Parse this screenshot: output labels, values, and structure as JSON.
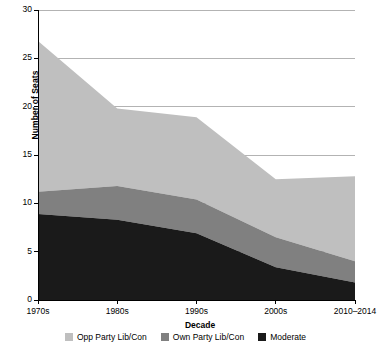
{
  "chart_data": {
    "type": "area",
    "title": "",
    "subtitle": "",
    "xlabel": "Decade",
    "ylabel": "Number of Seats",
    "categories": [
      "1970s",
      "1980s",
      "1990s",
      "2000s",
      "2010–2014"
    ],
    "ylim": [
      0,
      30
    ],
    "yticks": [
      0,
      5,
      10,
      15,
      20,
      25,
      30
    ],
    "ytick_labels": [
      "0",
      "5",
      "10",
      "15",
      "20",
      "25",
      "30"
    ],
    "grid": "horizontal",
    "stacked": true,
    "legend_position": "bottom",
    "series": [
      {
        "name": "Opp Party Lib/Con",
        "color": "#bfbfbf",
        "values": [
          15.6,
          8.0,
          8.5,
          6.0,
          8.8
        ]
      },
      {
        "name": "Own Party Lib/Con",
        "color": "#808080",
        "values": [
          2.3,
          3.5,
          3.5,
          3.1,
          2.2
        ]
      },
      {
        "name": "Moderate",
        "color": "#1a1a1a",
        "values": [
          8.9,
          8.3,
          6.9,
          3.4,
          1.8
        ]
      }
    ],
    "stack_tops": {
      "moderate": [
        8.9,
        8.3,
        6.9,
        3.4,
        1.8
      ],
      "own_party": [
        11.2,
        11.8,
        10.4,
        6.5,
        4.0
      ],
      "total": [
        26.8,
        19.8,
        18.9,
        12.5,
        12.8
      ]
    }
  },
  "legend": {
    "items": [
      {
        "label": "Opp Party Lib/Con",
        "color": "#bfbfbf"
      },
      {
        "label": "Own Party Lib/Con",
        "color": "#808080"
      },
      {
        "label": "Moderate",
        "color": "#1a1a1a"
      }
    ]
  }
}
